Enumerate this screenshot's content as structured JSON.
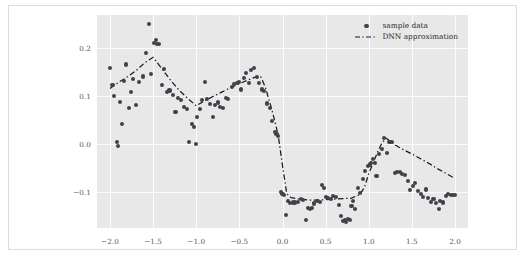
{
  "chart_data": {
    "type": "scatter",
    "title": "",
    "xlabel": "",
    "ylabel": "",
    "xlim": [
      -2.15,
      2.15
    ],
    "ylim": [
      -0.175,
      0.268
    ],
    "xticks": [
      -2.0,
      -1.5,
      -1.0,
      -0.5,
      0.0,
      0.5,
      1.0,
      1.5,
      2.0
    ],
    "xticklabels": [
      "−2.0",
      "−1.5",
      "−1.0",
      "−0.5",
      "0.0",
      "0.5",
      "1.0",
      "1.5",
      "2.0"
    ],
    "yticks": [
      0.2,
      0.1,
      0.0,
      -0.1
    ],
    "yticklabels": [
      "0.2",
      "0.1",
      "0.0",
      "−0.1"
    ],
    "grid": true,
    "legend_position": "upper right",
    "plot_bg_color": "#e8e8e8",
    "grid_color": "#fcfcfc",
    "marker_color": "#41414b",
    "line_color": "#1a1a1a",
    "series": [
      {
        "name": "sample data",
        "type": "scatter",
        "marker": "circle",
        "points": [
          [
            -2.0,
            0.157
          ],
          [
            -1.97,
            0.123
          ],
          [
            -1.95,
            0.1
          ],
          [
            -1.92,
            0.003
          ],
          [
            -1.91,
            -0.004
          ],
          [
            -1.88,
            0.088
          ],
          [
            -1.86,
            0.041
          ],
          [
            -1.84,
            0.13
          ],
          [
            -1.81,
            0.165
          ],
          [
            -1.78,
            0.074
          ],
          [
            -1.76,
            0.107
          ],
          [
            -1.73,
            0.135
          ],
          [
            -1.7,
            0.081
          ],
          [
            -1.66,
            0.128
          ],
          [
            -1.62,
            0.14
          ],
          [
            -1.58,
            0.189
          ],
          [
            -1.55,
            0.249
          ],
          [
            -1.52,
            0.145
          ],
          [
            -1.49,
            0.21
          ],
          [
            -1.47,
            0.216
          ],
          [
            -1.45,
            0.207
          ],
          [
            -1.43,
            0.208
          ],
          [
            -1.4,
            0.122
          ],
          [
            -1.37,
            0.155
          ],
          [
            -1.34,
            0.108
          ],
          [
            -1.31,
            0.111
          ],
          [
            -1.27,
            0.101
          ],
          [
            -1.24,
            0.066
          ],
          [
            -1.21,
            0.096
          ],
          [
            -1.18,
            0.091
          ],
          [
            -1.14,
            0.077
          ],
          [
            -1.11,
            0.072
          ],
          [
            -1.08,
            0.003
          ],
          [
            -1.05,
            0.042
          ],
          [
            -1.03,
            0.035
          ],
          [
            -1.0,
            0.0
          ],
          [
            -0.99,
            0.055
          ],
          [
            -0.96,
            0.072
          ],
          [
            -0.93,
            0.091
          ],
          [
            -0.9,
            0.128
          ],
          [
            -0.87,
            0.093
          ],
          [
            -0.84,
            0.083
          ],
          [
            -0.81,
            0.056
          ],
          [
            -0.78,
            0.081
          ],
          [
            -0.75,
            0.086
          ],
          [
            -0.72,
            0.077
          ],
          [
            -0.69,
            0.075
          ],
          [
            -0.66,
            0.095
          ],
          [
            -0.63,
            0.093
          ],
          [
            -0.59,
            0.118
          ],
          [
            -0.56,
            0.124
          ],
          [
            -0.53,
            0.126
          ],
          [
            -0.5,
            0.129
          ],
          [
            -0.48,
            0.113
          ],
          [
            -0.45,
            0.137
          ],
          [
            -0.42,
            0.148
          ],
          [
            -0.39,
            0.127
          ],
          [
            -0.36,
            0.153
          ],
          [
            -0.33,
            0.158
          ],
          [
            -0.3,
            0.139
          ],
          [
            -0.27,
            0.127
          ],
          [
            -0.24,
            0.113
          ],
          [
            -0.21,
            0.11
          ],
          [
            -0.18,
            0.084
          ],
          [
            -0.15,
            0.074
          ],
          [
            -0.12,
            0.048
          ],
          [
            -0.09,
            0.025
          ],
          [
            -0.07,
            0.02
          ],
          [
            -0.05,
            0.017
          ],
          [
            -0.02,
            -0.1
          ],
          [
            0.0,
            -0.104
          ],
          [
            0.02,
            -0.106
          ],
          [
            0.04,
            -0.148
          ],
          [
            0.06,
            -0.118
          ],
          [
            0.09,
            -0.123
          ],
          [
            0.12,
            -0.122
          ],
          [
            0.15,
            -0.122
          ],
          [
            0.18,
            -0.12
          ],
          [
            0.21,
            -0.114
          ],
          [
            0.24,
            -0.116
          ],
          [
            0.27,
            -0.159
          ],
          [
            0.3,
            -0.134
          ],
          [
            0.32,
            -0.136
          ],
          [
            0.34,
            -0.134
          ],
          [
            0.37,
            -0.124
          ],
          [
            0.4,
            -0.118
          ],
          [
            0.43,
            -0.12
          ],
          [
            0.46,
            -0.086
          ],
          [
            0.48,
            -0.092
          ],
          [
            0.5,
            -0.111
          ],
          [
            0.53,
            -0.113
          ],
          [
            0.56,
            -0.114
          ],
          [
            0.59,
            -0.108
          ],
          [
            0.62,
            -0.111
          ],
          [
            0.65,
            -0.127
          ],
          [
            0.68,
            -0.15
          ],
          [
            0.7,
            -0.16
          ],
          [
            0.72,
            -0.158
          ],
          [
            0.74,
            -0.162
          ],
          [
            0.76,
            -0.157
          ],
          [
            0.78,
            -0.158
          ],
          [
            0.8,
            -0.13
          ],
          [
            0.82,
            -0.119
          ],
          [
            0.84,
            -0.135
          ],
          [
            0.87,
            -0.091
          ],
          [
            0.9,
            -0.102
          ],
          [
            0.93,
            -0.073
          ],
          [
            0.96,
            -0.057
          ],
          [
            0.99,
            -0.046
          ],
          [
            1.01,
            -0.043
          ],
          [
            1.03,
            -0.04
          ],
          [
            1.05,
            -0.031
          ],
          [
            1.07,
            -0.04
          ],
          [
            1.09,
            -0.066
          ],
          [
            1.12,
            -0.022
          ],
          [
            1.15,
            -0.011
          ],
          [
            1.18,
            0.012
          ],
          [
            1.21,
            -0.019
          ],
          [
            1.24,
            0.003
          ],
          [
            1.27,
            0.004
          ],
          [
            1.3,
            -0.06
          ],
          [
            1.33,
            -0.059
          ],
          [
            1.36,
            -0.058
          ],
          [
            1.39,
            -0.063
          ],
          [
            1.42,
            -0.065
          ],
          [
            1.45,
            -0.078
          ],
          [
            1.48,
            -0.096
          ],
          [
            1.51,
            -0.088
          ],
          [
            1.54,
            -0.081
          ],
          [
            1.57,
            -0.098
          ],
          [
            1.6,
            -0.104
          ],
          [
            1.63,
            -0.11
          ],
          [
            1.66,
            -0.095
          ],
          [
            1.69,
            -0.113
          ],
          [
            1.72,
            -0.12
          ],
          [
            1.75,
            -0.114
          ],
          [
            1.78,
            -0.123
          ],
          [
            1.81,
            -0.135
          ],
          [
            1.83,
            -0.119
          ],
          [
            1.86,
            -0.122
          ],
          [
            1.89,
            -0.108
          ],
          [
            1.92,
            -0.104
          ],
          [
            1.95,
            -0.107
          ],
          [
            1.98,
            -0.106
          ],
          [
            2.0,
            -0.107
          ]
        ]
      },
      {
        "name": "DNN approximation",
        "type": "line",
        "linestyle": "dashed",
        "points": [
          [
            -2.0,
            0.115
          ],
          [
            -1.9,
            0.128
          ],
          [
            -1.8,
            0.139
          ],
          [
            -1.7,
            0.152
          ],
          [
            -1.6,
            0.168
          ],
          [
            -1.5,
            0.18
          ],
          [
            -1.4,
            0.157
          ],
          [
            -1.3,
            0.133
          ],
          [
            -1.2,
            0.112
          ],
          [
            -1.1,
            0.095
          ],
          [
            -1.0,
            0.079
          ],
          [
            -0.9,
            0.09
          ],
          [
            -0.8,
            0.099
          ],
          [
            -0.7,
            0.108
          ],
          [
            -0.6,
            0.117
          ],
          [
            -0.5,
            0.125
          ],
          [
            -0.4,
            0.133
          ],
          [
            -0.3,
            0.14
          ],
          [
            -0.25,
            0.139
          ],
          [
            -0.2,
            0.118
          ],
          [
            -0.15,
            0.088
          ],
          [
            -0.1,
            0.055
          ],
          [
            -0.05,
            0.018
          ],
          [
            0.0,
            -0.045
          ],
          [
            0.05,
            -0.104
          ],
          [
            0.1,
            -0.112
          ],
          [
            0.2,
            -0.115
          ],
          [
            0.3,
            -0.117
          ],
          [
            0.4,
            -0.117
          ],
          [
            0.5,
            -0.116
          ],
          [
            0.6,
            -0.115
          ],
          [
            0.7,
            -0.114
          ],
          [
            0.8,
            -0.113
          ],
          [
            0.9,
            -0.105
          ],
          [
            0.95,
            -0.09
          ],
          [
            1.0,
            -0.062
          ],
          [
            1.05,
            -0.04
          ],
          [
            1.1,
            -0.018
          ],
          [
            1.15,
            0.001
          ],
          [
            1.2,
            0.012
          ],
          [
            1.3,
            -0.002
          ],
          [
            1.4,
            -0.012
          ],
          [
            1.5,
            -0.021
          ],
          [
            1.6,
            -0.031
          ],
          [
            1.7,
            -0.041
          ],
          [
            1.8,
            -0.052
          ],
          [
            1.9,
            -0.062
          ],
          [
            2.0,
            -0.072
          ]
        ]
      }
    ],
    "legend": [
      {
        "label": "sample data",
        "key": "marker"
      },
      {
        "label": "DNN approximation",
        "key": "dashed-line"
      }
    ]
  }
}
